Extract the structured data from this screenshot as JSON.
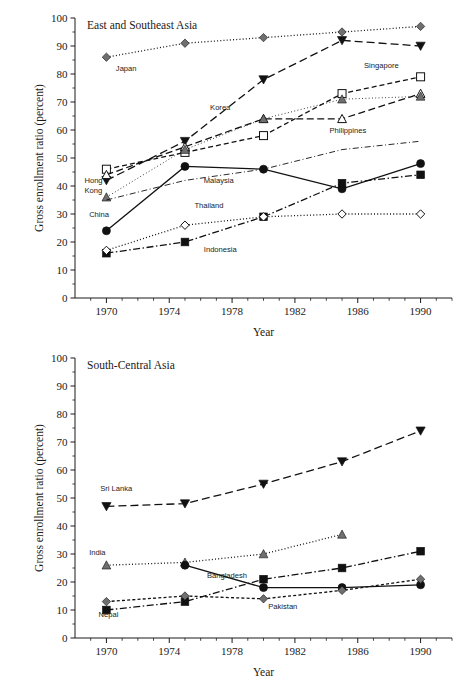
{
  "page": {
    "axis_y_title": "Gross enrollment ratio (percent)",
    "axis_x_title": "Year"
  },
  "chart_data": [
    {
      "id": "east-southeast-asia",
      "type": "line",
      "title": "East and Southeast Asia",
      "xlabel": "Year",
      "ylabel": "Gross enrollment ratio (percent)",
      "xlim": [
        1968,
        1992
      ],
      "ylim": [
        0,
        100
      ],
      "grid": false,
      "legend": "inline-labels",
      "x": [
        1970,
        1975,
        1980,
        1985,
        1990
      ],
      "xticks": [
        1970,
        1974,
        1978,
        1982,
        1986,
        1990
      ],
      "xticklabels": [
        "1970",
        "1974",
        "1978",
        "1982",
        "1986",
        "1990"
      ],
      "yticks": [
        0,
        10,
        20,
        30,
        40,
        50,
        60,
        70,
        80,
        90,
        100
      ],
      "yticklabels": [
        "0",
        "10",
        "20",
        "30",
        "40",
        "50",
        "60",
        "70",
        "80",
        "90",
        "100"
      ],
      "series": [
        {
          "name": "Japan",
          "label": "Japan",
          "values": [
            86,
            91,
            93,
            95,
            97
          ],
          "marker": "diamond-gray",
          "dash": "dotted"
        },
        {
          "name": "Korea",
          "label": "Korea",
          "values": [
            42,
            56,
            78,
            92,
            90
          ],
          "marker": "triangle-down-fill",
          "dash": "long-dash"
        },
        {
          "name": "Singapore",
          "label": "Singapore",
          "values": [
            46,
            52,
            58,
            73,
            79
          ],
          "marker": "square-open",
          "dash": "dashed"
        },
        {
          "name": "Philippines",
          "label": "Philippines",
          "values": [
            44,
            54,
            64,
            64,
            73
          ],
          "marker": "triangle-up-open",
          "dash": "dash-long"
        },
        {
          "name": "Hong Kong",
          "label": "Hong Kong",
          "values": [
            36,
            53,
            64,
            71,
            72
          ],
          "marker": "triangle-up-gray",
          "dash": "fine-dotted"
        },
        {
          "name": "Malaysia",
          "label": "Malaysia",
          "values": [
            35,
            42,
            46,
            53,
            56
          ],
          "marker": "none",
          "dash": "dash-dot-light"
        },
        {
          "name": "China",
          "label": "China",
          "values": [
            24,
            47,
            46,
            39,
            48
          ],
          "marker": "circle-fill",
          "dash": "solid"
        },
        {
          "name": "Indonesia",
          "label": "Indonesia",
          "values": [
            16,
            20,
            29,
            41,
            44
          ],
          "marker": "square-fill",
          "dash": "dash-dot"
        },
        {
          "name": "Thailand",
          "label": "Thailand",
          "values": [
            17,
            26,
            29,
            30,
            30
          ],
          "marker": "diamond-open",
          "dash": "dotted"
        }
      ]
    },
    {
      "id": "south-central-asia",
      "type": "line",
      "title": "South-Central Asia",
      "xlabel": "Year",
      "ylabel": "Gross enrollment ratio (percent)",
      "xlim": [
        1968,
        1992
      ],
      "ylim": [
        0,
        100
      ],
      "grid": false,
      "legend": "inline-labels",
      "x": [
        1970,
        1975,
        1980,
        1985,
        1990
      ],
      "xticks": [
        1970,
        1974,
        1978,
        1982,
        1986,
        1990
      ],
      "xticklabels": [
        "1970",
        "1974",
        "1978",
        "1982",
        "1986",
        "1990"
      ],
      "yticks": [
        0,
        10,
        20,
        30,
        40,
        50,
        60,
        70,
        80,
        90,
        100
      ],
      "yticklabels": [
        "0",
        "10",
        "20",
        "30",
        "40",
        "50",
        "60",
        "70",
        "80",
        "90",
        "100"
      ],
      "series": [
        {
          "name": "Sri Lanka",
          "label": "Sri Lanka",
          "values": [
            47,
            48,
            55,
            63,
            74
          ],
          "marker": "triangle-down-fill",
          "dash": "long-dash"
        },
        {
          "name": "India",
          "label": "India",
          "values": [
            26,
            27,
            30,
            37,
            null
          ],
          "marker": "triangle-up-gray",
          "dash": "dotted"
        },
        {
          "name": "Bangladesh",
          "label": "Bangladesh",
          "values": [
            null,
            26,
            18,
            18,
            19
          ],
          "marker": "circle-fill",
          "dash": "solid"
        },
        {
          "name": "Nepal",
          "label": "Nepal",
          "values": [
            10,
            13,
            21,
            25,
            31
          ],
          "marker": "square-fill",
          "dash": "dash-dot"
        },
        {
          "name": "Pakistan",
          "label": "Pakistan",
          "values": [
            13,
            15,
            14,
            17,
            21
          ],
          "marker": "diamond-gray",
          "dash": "short-dash"
        }
      ]
    }
  ],
  "annotations": {
    "top": [
      {
        "text": "Japan",
        "x": 1970.6,
        "y": 81
      },
      {
        "text": "Korea",
        "x": 1976.6,
        "y": 67
      },
      {
        "text": "Singapore",
        "x": 1986.4,
        "y": 82
      },
      {
        "text": "Philippines",
        "x": 1984.2,
        "y": 59
      },
      {
        "text": "Hong",
        "x": 1968.6,
        "y": 41
      },
      {
        "text": "Kong",
        "x": 1968.6,
        "y": 37.6
      },
      {
        "text": "Malaysia",
        "x": 1976.2,
        "y": 41
      },
      {
        "text": "China",
        "x": 1968.9,
        "y": 29
      },
      {
        "text": "Thailand",
        "x": 1975.6,
        "y": 32
      },
      {
        "text": "Indonesia",
        "x": 1976.2,
        "y": 16.5
      }
    ],
    "bottom": [
      {
        "text": "Sri Lanka",
        "x": 1969.6,
        "y": 52.5
      },
      {
        "text": "India",
        "x": 1968.9,
        "y": 29.5
      },
      {
        "text": "Bangladesh",
        "x": 1976.4,
        "y": 21.5
      },
      {
        "text": "Nepal",
        "x": 1969.5,
        "y": 7.5
      },
      {
        "text": "Pakistan",
        "x": 1980.3,
        "y": 10.5
      }
    ]
  },
  "colors": {
    "ink": "#111111",
    "gray_marker": "#6f6f6f",
    "background": "#ffffff"
  }
}
